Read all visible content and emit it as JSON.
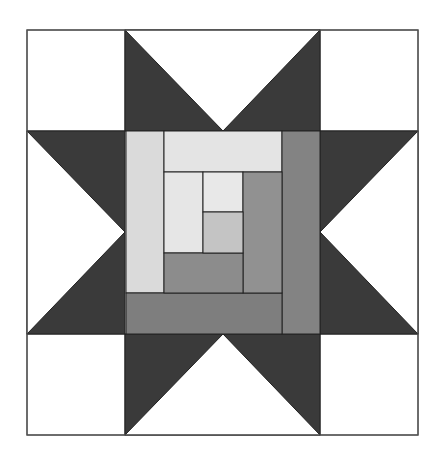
{
  "diagram": {
    "type": "quilt-block",
    "pattern": "star with log cabin center",
    "colors": {
      "background": "#ffffff",
      "star_dark": "#3a3a3a",
      "outline": "#222222",
      "log_lightest": "#e6e6e6",
      "log_light": "#dadada",
      "log_center": "#c4c4c4",
      "log_mid": "#919191",
      "log_dark": "#838383",
      "log_darkest": "#7a7a7a"
    },
    "grid": {
      "outer": [
        27,
        30,
        418,
        435
      ],
      "cols": [
        27,
        125,
        320,
        418
      ],
      "rows": [
        30,
        131,
        334,
        435
      ]
    }
  }
}
